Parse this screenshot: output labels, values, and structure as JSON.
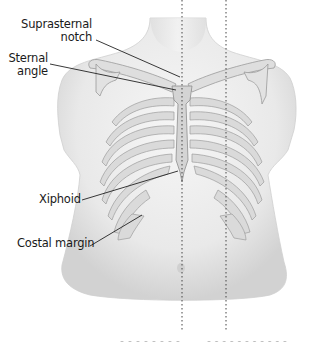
{
  "figure": {
    "type": "anatomical-illustration",
    "colors": {
      "skin": "#ececec",
      "skin_shadow": "#d6d6d6",
      "bone_fill": "#d9d9d9",
      "bone_outline": "#9a9a9a",
      "leader_line": "#222222",
      "dotted_line": "#444444",
      "text": "#1a1a1a"
    },
    "reference_lines": [
      {
        "id": "midsternal",
        "x": 182,
        "style": "dotted"
      },
      {
        "id": "midclavicular",
        "x": 226,
        "style": "dotted"
      }
    ],
    "labels": [
      {
        "id": "suprasternal-notch",
        "lines": [
          "Suprasternal",
          "notch"
        ],
        "anchor": [
          184,
          81
        ]
      },
      {
        "id": "sternal-angle",
        "lines": [
          "Sternal",
          "angle"
        ],
        "anchor": [
          180,
          96
        ]
      },
      {
        "id": "xiphoid",
        "text": "Xiphoid",
        "anchor": [
          178,
          171
        ]
      },
      {
        "id": "costal-margin",
        "text": "Costal margin",
        "anchor": [
          143,
          215
        ]
      }
    ],
    "clipped_caption": {
      "note": "bottom captions cut off by frame, illegible"
    }
  }
}
